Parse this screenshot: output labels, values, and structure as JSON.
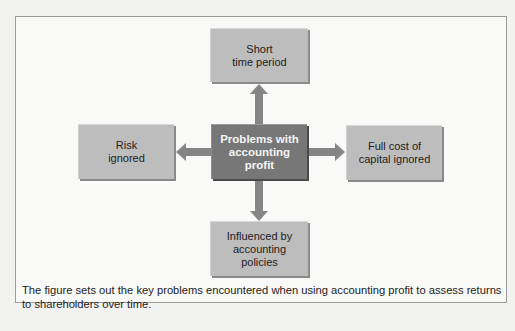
{
  "diagram": {
    "center": "Problems with\naccounting\nprofit",
    "nodes": {
      "top": "Short\ntime period",
      "left": "Risk\nignored",
      "right": "Full cost of\ncapital ignored",
      "bottom": "Influenced by\naccounting\npolicies"
    },
    "colors": {
      "center_fill": "#777777",
      "node_fill": "#bdbdbd",
      "arrow": "#858585",
      "frame_border": "#9a9a9a"
    }
  },
  "caption": "The figure sets out the key problems encountered when using accounting profit to assess returns to shareholders over time."
}
